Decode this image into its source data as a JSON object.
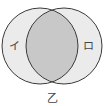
{
  "diagram": {
    "type": "venn",
    "sets": [
      {
        "id": "left",
        "label": "イ",
        "cx": 40,
        "cy": 46,
        "r": 38
      },
      {
        "id": "right",
        "label": "ロ",
        "cx": 64,
        "cy": 46,
        "r": 38
      }
    ],
    "intersection": {
      "highlighted": true
    },
    "caption": "乙",
    "colors": {
      "set_fill": "#ebebeb",
      "intersection_fill": "#c8c8c8",
      "stroke": "#3a3a3a",
      "background": "#ffffff",
      "text": "#444444"
    }
  }
}
